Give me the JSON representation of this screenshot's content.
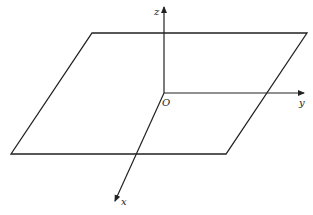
{
  "diagram": {
    "type": "3d-coordinate-system-with-plane",
    "labels": {
      "z_axis": "z",
      "y_axis": "y",
      "x_axis": "x",
      "origin": "O"
    },
    "colors": {
      "line": "#222222",
      "background": "#ffffff"
    }
  }
}
